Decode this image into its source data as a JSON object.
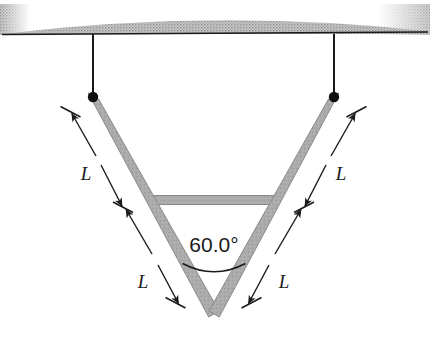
{
  "figure": {
    "type": "physics-mechanics-diagram",
    "background_color": "#ffffff",
    "ink_color": "#1a1a1a",
    "rod_color": "#aaaaaa",
    "rod_edge_color": "#8c8c8c",
    "ceiling_hatch_color": "#a9a9a9"
  },
  "ceiling": {
    "name": "ceiling",
    "line_y": 34,
    "line_x_start": 2,
    "line_x_end": 428,
    "hatch_label": "hatched-support-band"
  },
  "strings": [
    {
      "name": "left-string",
      "x": 93,
      "y_top": 34,
      "y_bottom": 97
    },
    {
      "name": "right-string",
      "x": 334,
      "y_top": 34,
      "y_bottom": 97
    }
  ],
  "pivots": [
    {
      "name": "left-pivot-point",
      "cx": 93,
      "cy": 97,
      "r": 5
    },
    {
      "name": "right-pivot-point",
      "cx": 334,
      "cy": 97,
      "r": 5
    }
  ],
  "rods": {
    "left_top": {
      "x1": 93,
      "y1": 97,
      "x2": 214,
      "y2": 310
    },
    "right_top": {
      "x1": 334,
      "y1": 97,
      "x2": 214,
      "y2": 310
    },
    "crossbar": {
      "x1": 152,
      "y1": 200,
      "x2": 276,
      "y2": 200
    },
    "thickness": 9
  },
  "angle": {
    "name": "apex-angle",
    "value": "60.0°",
    "label_x": 214,
    "label_y": 254,
    "arc_radius": 62
  },
  "dimensions": {
    "unit_label": "L",
    "segments": [
      {
        "name": "left-upper-length",
        "label": "L",
        "label_x": 93,
        "label_y": 174
      },
      {
        "name": "left-lower-length",
        "label": "L",
        "label_x": 158,
        "label_y": 283
      },
      {
        "name": "right-upper-length",
        "label": "L",
        "label_x": 332,
        "label_y": 174
      },
      {
        "name": "right-lower-length",
        "label": "L",
        "label_x": 268,
        "label_y": 283
      }
    ]
  }
}
